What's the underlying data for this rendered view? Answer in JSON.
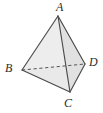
{
  "figure": {
    "type": "geometric-solid-diagram",
    "background_color": "#ffffff",
    "stroke_color": "#4a4a4a",
    "hidden_edge_color": "#555555",
    "face_fill_light": "#ededed",
    "face_fill_mid": "#e4e4e4",
    "face_fill_dark": "#dcdcdc",
    "label_color": "#2b2b2b"
  },
  "vertices": [
    {
      "name": "A",
      "label": "A",
      "x": 58,
      "y": 16,
      "label_x": 56,
      "label_y": 1,
      "position": "apex-top"
    },
    {
      "name": "B",
      "label": "B",
      "x": 22,
      "y": 70,
      "label_x": 5,
      "label_y": 62,
      "position": "left"
    },
    {
      "name": "C",
      "label": "C",
      "x": 70,
      "y": 92,
      "label_x": 64,
      "label_y": 97,
      "position": "bottom-front"
    },
    {
      "name": "D",
      "label": "D",
      "x": 85,
      "y": 64,
      "label_x": 89,
      "label_y": 56,
      "position": "right"
    }
  ],
  "edges": [
    {
      "name": "AB",
      "from": "A",
      "to": "B",
      "style": "solid",
      "hidden": false
    },
    {
      "name": "AC",
      "from": "A",
      "to": "C",
      "style": "solid",
      "hidden": false
    },
    {
      "name": "AD",
      "from": "A",
      "to": "D",
      "style": "solid",
      "hidden": false
    },
    {
      "name": "BC",
      "from": "B",
      "to": "C",
      "style": "solid",
      "hidden": false
    },
    {
      "name": "CD",
      "from": "C",
      "to": "D",
      "style": "solid",
      "hidden": false
    },
    {
      "name": "BD",
      "from": "B",
      "to": "D",
      "style": "dashed",
      "hidden": true
    }
  ],
  "faces": [
    {
      "name": "ABC",
      "vertices": [
        "A",
        "B",
        "C"
      ],
      "fill": "#ededed",
      "visible": true
    },
    {
      "name": "ACD",
      "vertices": [
        "A",
        "C",
        "D"
      ],
      "fill": "#e0e0e0",
      "visible": true
    },
    {
      "name": "BCD",
      "vertices": [
        "B",
        "C",
        "D"
      ],
      "fill": "#e8e8e8",
      "visible": true
    },
    {
      "name": "ABD",
      "vertices": [
        "A",
        "B",
        "D"
      ],
      "fill": "none",
      "visible": false
    }
  ],
  "labels": {
    "A": "A",
    "B": "B",
    "C": "C",
    "D": "D"
  }
}
